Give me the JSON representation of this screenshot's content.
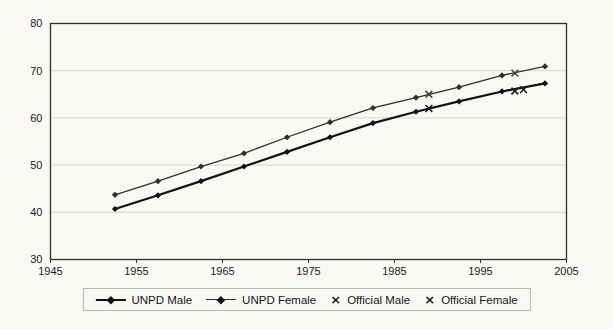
{
  "chart_data": {
    "type": "line",
    "title": "",
    "xlabel": "",
    "ylabel": "",
    "xlim": [
      1945,
      2005
    ],
    "ylim": [
      30,
      80
    ],
    "x_ticks": [
      1945,
      1955,
      1965,
      1975,
      1985,
      1995,
      2005
    ],
    "y_ticks": [
      30,
      40,
      50,
      60,
      70,
      80
    ],
    "grid": "horizontal",
    "legend_position": "bottom",
    "x": [
      1952.5,
      1957.5,
      1962.5,
      1967.5,
      1972.5,
      1977.5,
      1982.5,
      1987.5,
      1992.5,
      1997.5,
      2002.5
    ],
    "series": [
      {
        "name": "UNPD Male",
        "marker": "diamond",
        "color": "#121212",
        "stroke_width": 2.2,
        "values": [
          40.7,
          43.6,
          46.6,
          49.7,
          52.8,
          55.9,
          58.9,
          61.3,
          63.5,
          65.6,
          67.3
        ]
      },
      {
        "name": "UNPD Female",
        "marker": "diamond",
        "color": "#2e2e2e",
        "stroke_width": 1.3,
        "values": [
          43.7,
          46.6,
          49.7,
          52.5,
          55.9,
          59.1,
          62.1,
          64.3,
          66.5,
          69.0,
          70.9
        ]
      }
    ],
    "scatter": [
      {
        "name": "Official Male",
        "marker": "x",
        "glyph": "×",
        "color": "#1a1a1a",
        "points": [
          [
            1989,
            62.0
          ],
          [
            1999,
            65.7
          ],
          [
            2000,
            66.0
          ]
        ]
      },
      {
        "name": "Official Female",
        "marker": "x",
        "glyph": "×",
        "color": "#3a3a3a",
        "points": [
          [
            1989,
            65.0
          ],
          [
            1999,
            69.5
          ]
        ]
      }
    ]
  },
  "colors": {
    "background": "#f9f8f5",
    "frame": "#2e2e2e",
    "gridline": "#d8d7d2",
    "tick_label": "#1a1a1a",
    "legend_border": "#b9b8b2"
  }
}
